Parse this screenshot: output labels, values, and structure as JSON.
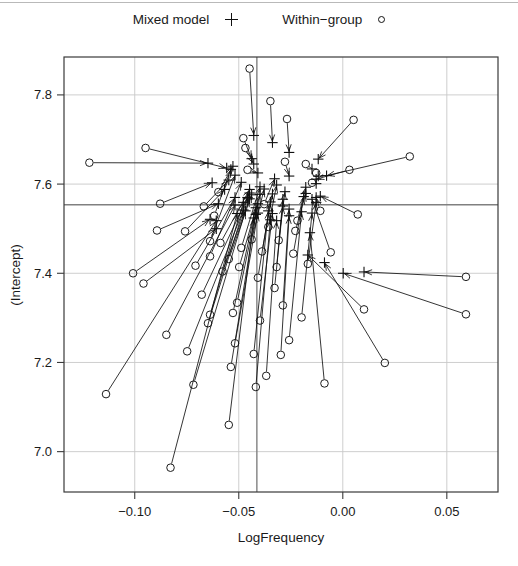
{
  "legend": {
    "entries": [
      {
        "label": "Mixed model",
        "symbol": "plus-icon"
      },
      {
        "label": "Within−group",
        "symbol": "circle-icon"
      }
    ]
  },
  "chart_data": {
    "type": "scatter",
    "title": "",
    "xlabel": "LogFrequency",
    "ylabel": "(Intercept)",
    "xlim": [
      -0.134,
      0.0746
    ],
    "ylim": [
      6.9095,
      7.885
    ],
    "xticks": [
      -0.1,
      -0.05,
      0.0,
      0.05
    ],
    "xticklabels": [
      "−0.10",
      "−0.05",
      "0.00",
      "0.05"
    ],
    "yticks": [
      7.0,
      7.2,
      7.4,
      7.6,
      7.8
    ],
    "yticklabels": [
      "7.0",
      "7.2",
      "7.4",
      "7.6",
      "7.8"
    ],
    "grid": true,
    "grid_color": "#c8c8c8",
    "reference_lines": {
      "vline_x": -0.0413,
      "hline_y": 7.5535,
      "color": "#808080"
    },
    "series": [
      {
        "name": "Within−group",
        "symbol": "circle",
        "marker_color": "#111111"
      },
      {
        "name": "Mixed model",
        "symbol": "plus",
        "marker_color": "#111111"
      }
    ],
    "arrow_note": "each within−group estimate is joined by an arrow to the corresponding mixed−model (shrunken) estimate",
    "points": [
      {
        "x0": -0.1218,
        "y0": 7.648,
        "x1": -0.0648,
        "y1": 7.647
      },
      {
        "x0": -0.0948,
        "y0": 7.681,
        "x1": -0.0558,
        "y1": 7.636
      },
      {
        "x0": -0.0893,
        "y0": 7.496,
        "x1": -0.0598,
        "y1": 7.556
      },
      {
        "x0": -0.1008,
        "y0": 7.4,
        "x1": -0.0638,
        "y1": 7.521
      },
      {
        "x0": -0.0958,
        "y0": 7.377,
        "x1": -0.0608,
        "y1": 7.5
      },
      {
        "x0": -0.1138,
        "y0": 7.129,
        "x1": -0.0608,
        "y1": 7.518
      },
      {
        "x0": -0.0848,
        "y0": 7.262,
        "x1": -0.0518,
        "y1": 7.553
      },
      {
        "x0": -0.0828,
        "y0": 6.964,
        "x1": -0.0508,
        "y1": 7.534
      },
      {
        "x0": -0.0748,
        "y0": 7.225,
        "x1": -0.0478,
        "y1": 7.542
      },
      {
        "x0": -0.0718,
        "y0": 7.15,
        "x1": -0.0468,
        "y1": 7.54
      },
      {
        "x0": -0.0678,
        "y0": 7.352,
        "x1": -0.0448,
        "y1": 7.58
      },
      {
        "x0": -0.0648,
        "y0": 7.288,
        "x1": -0.0458,
        "y1": 7.57
      },
      {
        "x0": -0.0638,
        "y0": 7.438,
        "x1": -0.0488,
        "y1": 7.604
      },
      {
        "x0": -0.0638,
        "y0": 7.472,
        "x1": -0.0518,
        "y1": 7.62
      },
      {
        "x0": -0.0618,
        "y0": 7.529,
        "x1": -0.0538,
        "y1": 7.633
      },
      {
        "x0": -0.0598,
        "y0": 7.582,
        "x1": -0.0528,
        "y1": 7.64
      },
      {
        "x0": -0.0578,
        "y0": 7.404,
        "x1": -0.0448,
        "y1": 7.567
      },
      {
        "x0": -0.0548,
        "y0": 7.06,
        "x1": -0.0428,
        "y1": 7.524
      },
      {
        "x0": -0.0538,
        "y0": 7.19,
        "x1": -0.0418,
        "y1": 7.532
      },
      {
        "x0": -0.0528,
        "y0": 7.311,
        "x1": -0.0418,
        "y1": 7.547
      },
      {
        "x0": -0.0518,
        "y0": 7.243,
        "x1": -0.0408,
        "y1": 7.535
      },
      {
        "x0": -0.0508,
        "y0": 7.334,
        "x1": -0.0408,
        "y1": 7.556
      },
      {
        "x0": -0.0498,
        "y0": 7.414,
        "x1": -0.0398,
        "y1": 7.577
      },
      {
        "x0": -0.0488,
        "y0": 7.457,
        "x1": -0.0398,
        "y1": 7.594
      },
      {
        "x0": -0.0478,
        "y0": 7.703,
        "x1": -0.0438,
        "y1": 7.657
      },
      {
        "x0": -0.0468,
        "y0": 7.681,
        "x1": -0.0428,
        "y1": 7.645
      },
      {
        "x0": -0.0458,
        "y0": 7.632,
        "x1": -0.0408,
        "y1": 7.625
      },
      {
        "x0": -0.0448,
        "y0": 7.859,
        "x1": -0.0428,
        "y1": 7.709
      },
      {
        "x0": -0.0428,
        "y0": 7.219,
        "x1": -0.0358,
        "y1": 7.54
      },
      {
        "x0": -0.0418,
        "y0": 7.145,
        "x1": -0.0348,
        "y1": 7.52
      },
      {
        "x0": -0.0408,
        "y0": 7.39,
        "x1": -0.0348,
        "y1": 7.56
      },
      {
        "x0": -0.0398,
        "y0": 7.294,
        "x1": -0.0338,
        "y1": 7.534
      },
      {
        "x0": -0.0388,
        "y0": 7.449,
        "x1": -0.0338,
        "y1": 7.578
      },
      {
        "x0": -0.0368,
        "y0": 7.17,
        "x1": -0.0318,
        "y1": 7.518
      },
      {
        "x0": -0.0358,
        "y0": 7.504,
        "x1": -0.0318,
        "y1": 7.598
      },
      {
        "x0": -0.0348,
        "y0": 7.786,
        "x1": -0.0338,
        "y1": 7.693
      },
      {
        "x0": -0.0328,
        "y0": 7.367,
        "x1": -0.0288,
        "y1": 7.551
      },
      {
        "x0": -0.0318,
        "y0": 7.414,
        "x1": -0.0288,
        "y1": 7.566
      },
      {
        "x0": -0.0308,
        "y0": 7.474,
        "x1": -0.0278,
        "y1": 7.583
      },
      {
        "x0": -0.0298,
        "y0": 7.217,
        "x1": -0.0258,
        "y1": 7.529
      },
      {
        "x0": -0.0288,
        "y0": 7.328,
        "x1": -0.0258,
        "y1": 7.544
      },
      {
        "x0": -0.0278,
        "y0": 7.65,
        "x1": -0.0258,
        "y1": 7.618
      },
      {
        "x0": -0.0268,
        "y0": 7.746,
        "x1": -0.0258,
        "y1": 7.671
      },
      {
        "x0": -0.0258,
        "y0": 7.25,
        "x1": -0.0198,
        "y1": 7.538
      },
      {
        "x0": -0.0238,
        "y0": 7.444,
        "x1": -0.0188,
        "y1": 7.572
      },
      {
        "x0": -0.0218,
        "y0": 7.518,
        "x1": -0.0178,
        "y1": 7.593
      },
      {
        "x0": -0.0198,
        "y0": 7.301,
        "x1": -0.0148,
        "y1": 7.535
      },
      {
        "x0": -0.0168,
        "y0": 7.421,
        "x1": -0.0128,
        "y1": 7.559
      },
      {
        "x0": -0.0148,
        "y0": 7.603,
        "x1": -0.0128,
        "y1": 7.601
      },
      {
        "x0": -0.0128,
        "y0": 7.625,
        "x1": -0.0118,
        "y1": 7.618
      },
      {
        "x0": -0.0108,
        "y0": 7.54,
        "x1": -0.0128,
        "y1": 7.57
      },
      {
        "x0": -0.0088,
        "y0": 7.153,
        "x1": -0.0158,
        "y1": 7.491
      },
      {
        "x0": -0.0058,
        "y0": 7.447,
        "x1": -0.0148,
        "y1": 7.566
      },
      {
        "x0": 0.0032,
        "y0": 7.632,
        "x1": -0.0128,
        "y1": 7.611
      },
      {
        "x0": 0.0052,
        "y0": 7.744,
        "x1": -0.0118,
        "y1": 7.656
      },
      {
        "x0": 0.0072,
        "y0": 7.532,
        "x1": -0.0108,
        "y1": 7.573
      },
      {
        "x0": 0.0102,
        "y0": 7.319,
        "x1": -0.0168,
        "y1": 7.441
      },
      {
        "x0": 0.0202,
        "y0": 7.199,
        "x1": -0.0088,
        "y1": 7.424
      },
      {
        "x0": 0.0322,
        "y0": 7.662,
        "x1": -0.0078,
        "y1": 7.619
      },
      {
        "x0": 0.0592,
        "y0": 7.308,
        "x1": 0.0002,
        "y1": 7.4
      },
      {
        "x0": 0.0592,
        "y0": 7.392,
        "x1": 0.0102,
        "y1": 7.403
      },
      {
        "x0": -0.0668,
        "y0": 7.55,
        "x1": -0.0548,
        "y1": 7.609
      },
      {
        "x0": -0.0758,
        "y0": 7.494,
        "x1": -0.0568,
        "y1": 7.588
      },
      {
        "x0": -0.0878,
        "y0": 7.556,
        "x1": -0.0628,
        "y1": 7.603
      },
      {
        "x0": -0.0708,
        "y0": 7.417,
        "x1": -0.0518,
        "y1": 7.57
      },
      {
        "x0": -0.0638,
        "y0": 7.307,
        "x1": -0.0478,
        "y1": 7.559
      },
      {
        "x0": -0.0588,
        "y0": 7.468,
        "x1": -0.0448,
        "y1": 7.588
      },
      {
        "x0": -0.0548,
        "y0": 7.432,
        "x1": -0.0438,
        "y1": 7.576
      },
      {
        "x0": -0.0438,
        "y0": 7.476,
        "x1": -0.0378,
        "y1": 7.589
      },
      {
        "x0": -0.0378,
        "y0": 7.555,
        "x1": -0.0328,
        "y1": 7.612
      },
      {
        "x0": -0.0228,
        "y0": 7.495,
        "x1": -0.0178,
        "y1": 7.579
      },
      {
        "x0": -0.0178,
        "y0": 7.645,
        "x1": -0.0148,
        "y1": 7.634
      }
    ]
  }
}
